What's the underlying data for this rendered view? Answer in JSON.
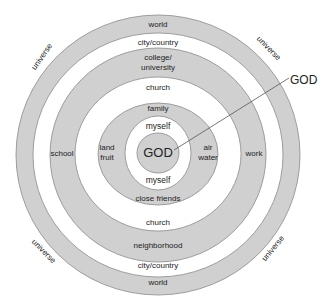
{
  "diagram": {
    "colors": {
      "ring_fill": "#d0d0d0",
      "ring_stroke": "#8a8a8a",
      "background": "#ffffff",
      "text": "#222222"
    },
    "center": {
      "x": 158,
      "y": 154
    },
    "rings": [
      {
        "name": "world",
        "outer_r": 141,
        "inner_r": 123,
        "fill": "gray",
        "top_label": "world",
        "bottom_label": "world"
      },
      {
        "name": "city-country",
        "outer_r": 123,
        "inner_r": 107,
        "fill": "white",
        "top_label": "city/country",
        "bottom_label": "city/country"
      },
      {
        "name": "college-neighborhood",
        "outer_r": 107,
        "inner_r": 77,
        "fill": "gray",
        "top_label_line1": "college/",
        "top_label_line2": "university",
        "bottom_label": "neighborhood",
        "left_label": "school",
        "right_label": "work"
      },
      {
        "name": "church",
        "outer_r": 77,
        "inner_r": 51,
        "fill": "white",
        "top_label": "church",
        "bottom_label": "church"
      },
      {
        "name": "family",
        "outer_r": 51,
        "inner_r": 37,
        "fill": "gray",
        "top_label": "family",
        "bottom_label": "close friends",
        "left_label_line1": "land",
        "left_label_line2": "fruit",
        "right_label_line1": "air",
        "right_label_line2": "water"
      },
      {
        "name": "myself",
        "outer_r": 37,
        "inner_r": 20,
        "fill": "white",
        "top_label": "myself",
        "bottom_label": "myself"
      },
      {
        "name": "god-core",
        "outer_r": 20,
        "fill": "gray",
        "label": "GOD"
      }
    ],
    "outer_labels": {
      "top_left": "universe",
      "top_right": "universe",
      "bottom_left": "universe",
      "bottom_right": "universe"
    },
    "callout": {
      "label": "GOD",
      "from": {
        "x": 174,
        "y": 150
      },
      "to": {
        "x": 289,
        "y": 78
      }
    }
  }
}
